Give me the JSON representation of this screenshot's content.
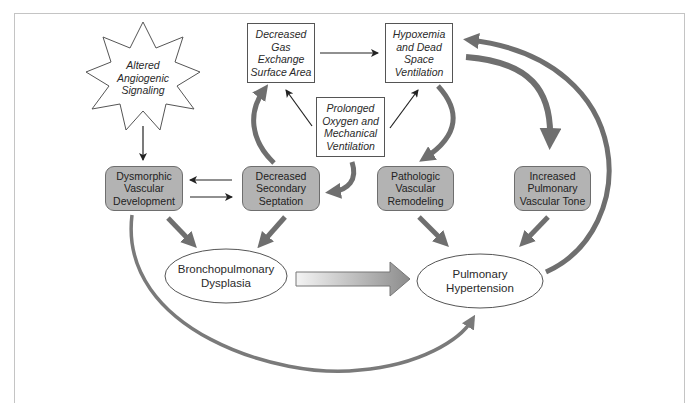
{
  "diagram": {
    "nodes": {
      "angiogenic": {
        "label": "Altered\nAngiogenic\nSignaling",
        "shape": "starburst",
        "style": "italic"
      },
      "gas_exchange": {
        "label": "Decreased\nGas Exchange\nSurface Area",
        "shape": "rectangle",
        "style": "italic"
      },
      "hypoxemia": {
        "label": "Hypoxemia\nand Dead\nSpace\nVentilation",
        "shape": "rectangle",
        "style": "italic"
      },
      "oxygen_ventilation": {
        "label": "Prolonged\nOxygen and\nMechanical\nVentilation",
        "shape": "rectangle",
        "style": "italic"
      },
      "dysmorphic": {
        "label": "Dysmorphic\nVascular\nDevelopment",
        "shape": "rounded-rectangle",
        "fill": "#b3b3b3"
      },
      "septation": {
        "label": "Decreased\nSecondary\nSeptation",
        "shape": "rounded-rectangle",
        "fill": "#b3b3b3"
      },
      "remodeling": {
        "label": "Pathologic\nVascular\nRemodeling",
        "shape": "rounded-rectangle",
        "fill": "#b3b3b3"
      },
      "vascular_tone": {
        "label": "Increased\nPulmonary\nVascular Tone",
        "shape": "rounded-rectangle",
        "fill": "#b3b3b3"
      },
      "bpd": {
        "label": "Bronchopulmonary\nDysplasia",
        "shape": "ellipse"
      },
      "ph": {
        "label": "Pulmonary\nHypertension",
        "shape": "ellipse"
      }
    },
    "edges": [
      {
        "from": "angiogenic",
        "to": "dysmorphic",
        "style": "thin-black"
      },
      {
        "from": "septation",
        "to": "dysmorphic",
        "style": "thin-black"
      },
      {
        "from": "dysmorphic",
        "to": "septation",
        "style": "thin-black"
      },
      {
        "from": "gas_exchange",
        "to": "hypoxemia",
        "style": "thin-black"
      },
      {
        "from": "oxygen_ventilation",
        "to": "gas_exchange",
        "style": "thin-black"
      },
      {
        "from": "oxygen_ventilation",
        "to": "hypoxemia",
        "style": "thin-black"
      },
      {
        "from": "oxygen_ventilation",
        "to": "septation",
        "style": "thick-gray-curved"
      },
      {
        "from": "septation",
        "to": "gas_exchange",
        "style": "thick-gray-curved"
      },
      {
        "from": "hypoxemia",
        "to": "remodeling",
        "style": "thick-gray-curved"
      },
      {
        "from": "hypoxemia",
        "to": "vascular_tone",
        "style": "thick-gray-curved"
      },
      {
        "from": "dysmorphic",
        "to": "bpd",
        "style": "thick-gray"
      },
      {
        "from": "septation",
        "to": "bpd",
        "style": "thick-gray"
      },
      {
        "from": "remodeling",
        "to": "ph",
        "style": "thick-gray"
      },
      {
        "from": "vascular_tone",
        "to": "ph",
        "style": "thick-gray"
      },
      {
        "from": "bpd",
        "to": "ph",
        "style": "block-gradient"
      },
      {
        "from": "ph",
        "to": "hypoxemia",
        "style": "thick-gray-arc"
      },
      {
        "from": "dysmorphic",
        "to": "ph",
        "style": "thick-gray-arc"
      }
    ],
    "colors": {
      "box_fill": "#b3b3b3",
      "arrow_gray": "#6f6f6f",
      "line_black": "#222222",
      "frame": "#c4c4c4"
    }
  }
}
